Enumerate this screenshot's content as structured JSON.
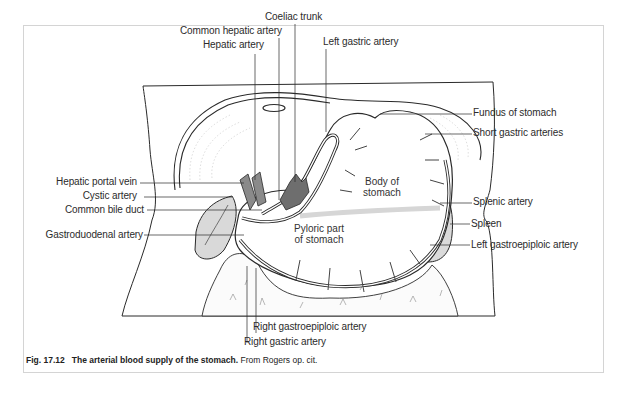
{
  "figure": {
    "number": "Fig. 17.12",
    "title": "The arterial blood supply of the stomach.",
    "source": "From Rogers op. cit."
  },
  "labels": {
    "coeliac_trunk": "Coeliac trunk",
    "common_hepatic_artery": "Common hepatic artery",
    "hepatic_artery": "Hepatic artery",
    "left_gastric_artery": "Left gastric artery",
    "fundus_of_stomach": "Fundus of stomach",
    "short_gastric_arteries": "Short gastric arteries",
    "hepatic_portal_vein": "Hepatic portal vein",
    "cystic_artery": "Cystic artery",
    "common_bile_duct": "Common bile duct",
    "gastroduodenal_artery": "Gastroduodenal artery",
    "splenic_artery": "Splenic artery",
    "spleen": "Spleen",
    "left_gastroepiploic_artery": "Left gastroepiploic artery",
    "right_gastroepiploic_artery": "Right gastroepiploic artery",
    "right_gastric_artery": "Right gastric artery"
  },
  "organs": {
    "body_of_stomach_line1": "Body of",
    "body_of_stomach_line2": "stomach",
    "pyloric_line1": "Pyloric part",
    "pyloric_line2": "of stomach"
  },
  "colors": {
    "line": "#2a2a2a",
    "vessel_fill": "#6e6e6e",
    "shade": "#d6d6d6",
    "frame": "#d4d4d4"
  }
}
